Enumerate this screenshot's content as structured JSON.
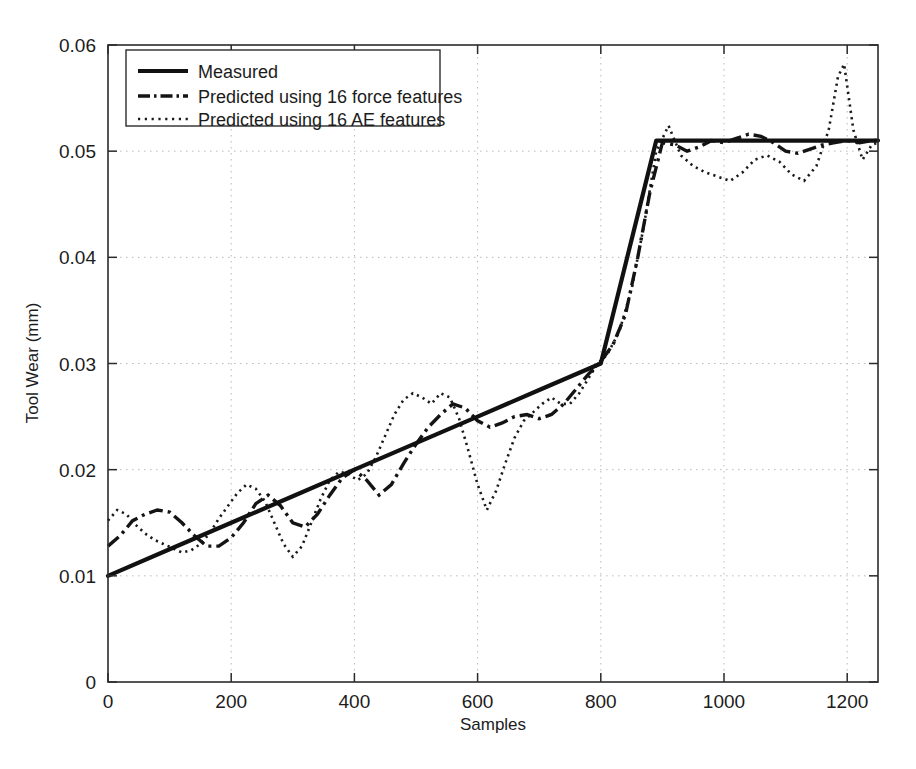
{
  "chart_data": {
    "type": "line",
    "title": "",
    "xlabel": "Samples",
    "ylabel": "Tool Wear (mm)",
    "xlim": [
      0,
      1250
    ],
    "ylim": [
      0,
      0.06
    ],
    "xticks": [
      0,
      200,
      400,
      600,
      800,
      1000,
      1200
    ],
    "xtick_labels": [
      "0",
      "200",
      "400",
      "600",
      "800",
      "1000",
      "1200"
    ],
    "yticks": [
      0,
      0.01,
      0.02,
      0.03,
      0.04,
      0.05,
      0.06
    ],
    "ytick_labels": [
      "0",
      "0.01",
      "0.02",
      "0.03",
      "0.04",
      "0.05",
      "0.06"
    ],
    "grid": true,
    "grid_style": "dotted",
    "legend_position": "upper-left",
    "line_color": "#111111",
    "grid_color": "#b9b9b9",
    "axis_color": "#2b2b2b",
    "series": [
      {
        "name": "Measured",
        "style": "solid",
        "x": [
          0,
          100,
          200,
          300,
          400,
          500,
          600,
          700,
          800,
          830,
          860,
          890,
          950,
          1000,
          1100,
          1200,
          1250
        ],
        "values": [
          0.01,
          0.0125,
          0.015,
          0.0175,
          0.02,
          0.0225,
          0.025,
          0.0275,
          0.03,
          0.037,
          0.044,
          0.051,
          0.051,
          0.051,
          0.051,
          0.051,
          0.051
        ]
      },
      {
        "name": "Predicted using 16 force features",
        "style": "dash-dot",
        "x": [
          0,
          20,
          40,
          60,
          80,
          100,
          120,
          140,
          160,
          180,
          200,
          220,
          240,
          260,
          280,
          300,
          320,
          340,
          360,
          380,
          400,
          420,
          440,
          460,
          480,
          500,
          520,
          540,
          560,
          580,
          600,
          620,
          640,
          660,
          680,
          700,
          720,
          740,
          760,
          780,
          800,
          820,
          840,
          860,
          880,
          900,
          920,
          940,
          960,
          980,
          1000,
          1020,
          1040,
          1060,
          1080,
          1100,
          1120,
          1140,
          1160,
          1180,
          1200,
          1220,
          1240,
          1250
        ],
        "values": [
          0.0128,
          0.0138,
          0.0152,
          0.0158,
          0.0162,
          0.016,
          0.015,
          0.0138,
          0.0128,
          0.0128,
          0.0136,
          0.015,
          0.0168,
          0.0176,
          0.0166,
          0.015,
          0.0146,
          0.0158,
          0.0176,
          0.0192,
          0.02,
          0.019,
          0.0176,
          0.0186,
          0.0206,
          0.0224,
          0.024,
          0.0252,
          0.0262,
          0.0258,
          0.0246,
          0.024,
          0.0244,
          0.025,
          0.0252,
          0.0248,
          0.0252,
          0.0262,
          0.0276,
          0.029,
          0.0302,
          0.0318,
          0.0346,
          0.04,
          0.0462,
          0.0508,
          0.0506,
          0.05,
          0.0504,
          0.051,
          0.0508,
          0.0512,
          0.0516,
          0.0514,
          0.0508,
          0.05,
          0.0498,
          0.0502,
          0.0506,
          0.0508,
          0.051,
          0.0508,
          0.051,
          0.051
        ]
      },
      {
        "name": "Predicted using 16 AE features",
        "style": "dotted",
        "x": [
          0,
          15,
          30,
          45,
          60,
          75,
          90,
          105,
          120,
          135,
          150,
          165,
          180,
          195,
          210,
          225,
          240,
          255,
          270,
          285,
          300,
          315,
          330,
          345,
          360,
          375,
          390,
          405,
          420,
          435,
          450,
          465,
          480,
          495,
          510,
          525,
          540,
          555,
          570,
          585,
          600,
          615,
          630,
          645,
          660,
          675,
          690,
          705,
          720,
          735,
          750,
          765,
          780,
          795,
          810,
          830,
          850,
          870,
          890,
          910,
          930,
          950,
          970,
          990,
          1010,
          1030,
          1050,
          1070,
          1090,
          1110,
          1130,
          1150,
          1170,
          1185,
          1195,
          1210,
          1225,
          1240,
          1250
        ],
        "values": [
          0.0152,
          0.0162,
          0.0158,
          0.0148,
          0.014,
          0.0134,
          0.013,
          0.0126,
          0.0122,
          0.0124,
          0.013,
          0.014,
          0.0154,
          0.0166,
          0.0178,
          0.0186,
          0.0182,
          0.017,
          0.015,
          0.013,
          0.0118,
          0.0128,
          0.015,
          0.0172,
          0.019,
          0.0198,
          0.0196,
          0.019,
          0.0196,
          0.0212,
          0.0232,
          0.0252,
          0.0266,
          0.0272,
          0.0268,
          0.0262,
          0.0272,
          0.0268,
          0.0248,
          0.0218,
          0.0186,
          0.0162,
          0.018,
          0.0206,
          0.023,
          0.0246,
          0.0254,
          0.0262,
          0.0268,
          0.0262,
          0.0262,
          0.0272,
          0.0286,
          0.03,
          0.0308,
          0.033,
          0.037,
          0.043,
          0.05,
          0.0524,
          0.0496,
          0.0486,
          0.048,
          0.0476,
          0.0472,
          0.048,
          0.0492,
          0.0496,
          0.049,
          0.0478,
          0.0472,
          0.0486,
          0.052,
          0.057,
          0.0582,
          0.052,
          0.0492,
          0.0506,
          0.0508
        ]
      }
    ]
  },
  "legend": {
    "items": [
      {
        "label": "Measured",
        "style": "solid"
      },
      {
        "label": "Predicted using 16 force features",
        "style": "dash-dot"
      },
      {
        "label": "Predicted using 16 AE features",
        "style": "dotted"
      }
    ]
  }
}
